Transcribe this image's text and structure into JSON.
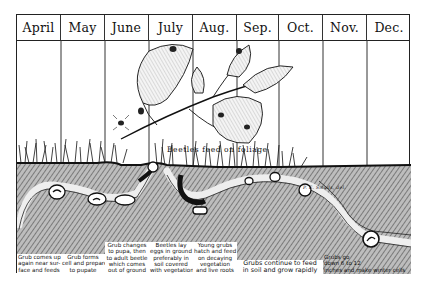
{
  "diagram": {
    "type": "life-cycle-calendar",
    "months": [
      "April",
      "May",
      "June",
      "July",
      "Aug.",
      "Sep.",
      "Oct.",
      "Nov.",
      "Dec."
    ],
    "caption_foliage": "Beetles feed on foliage",
    "signature": "P. E. Smuds, del.",
    "notes": [
      {
        "month_span": "April",
        "lines": [
          "Grub comes up",
          "again near sur-",
          "face and feeds"
        ]
      },
      {
        "month_span": "May",
        "lines": [
          "Grub forms",
          "cell and prepares",
          "to pupate"
        ]
      },
      {
        "month_span": "June",
        "lines": [
          "Grub changes",
          "to pupa, then",
          "to adult beetle",
          "which comes",
          "out of ground"
        ]
      },
      {
        "month_span": "July",
        "lines": [
          "Beetles lay",
          "eggs in ground",
          "preferably in",
          "soil covered",
          "with vegetation"
        ]
      },
      {
        "month_span": "Aug.",
        "lines": [
          "Young grubs",
          "hatch and feed",
          "on decaying",
          "vegetation",
          "and live roots"
        ]
      },
      {
        "month_span": "Sep.-Oct.",
        "lines": [
          "Grubs continue to feed",
          "in soil and grow rapidly"
        ]
      },
      {
        "month_span": "Nov.-Dec.",
        "lines": [
          "Grubs go",
          "down 6 to 12",
          "inches and make winter cells"
        ]
      }
    ],
    "colors": {
      "ink": "#111111",
      "paper": "#ffffff",
      "soil": "#9a9a9a"
    }
  }
}
